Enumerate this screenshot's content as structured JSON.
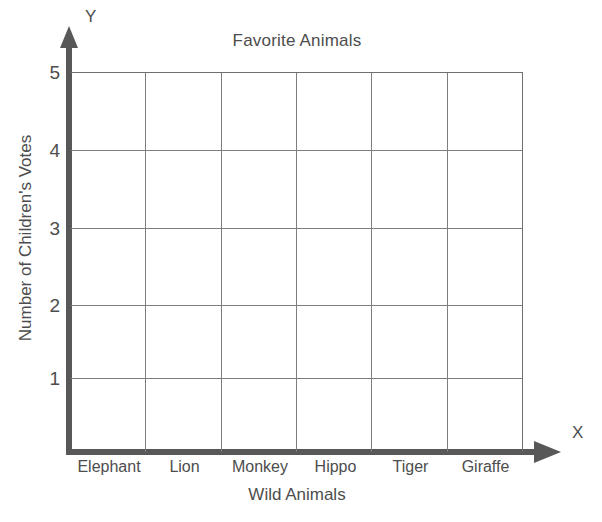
{
  "chart_data": {
    "type": "bar",
    "title": "Favorite Animals",
    "xlabel": "Wild Animals",
    "ylabel": "Number of Children's Votes",
    "categories": [
      "Elephant",
      "Lion",
      "Monkey",
      "Hippo",
      "Tiger",
      "Giraffe"
    ],
    "values": [
      0,
      0,
      0,
      0,
      0,
      0
    ],
    "yticks": [
      "1",
      "2",
      "3",
      "4",
      "5"
    ],
    "ylim": [
      0,
      5
    ],
    "grid": true,
    "legend": "none",
    "note": "Blank grid template — no bars are drawn; every category has no recorded votes.",
    "axis_letters": {
      "x": "X",
      "y": "Y"
    }
  },
  "colors": {
    "axis": "#585858",
    "grid": "#7d7d7d",
    "text": "#4d4d4d",
    "background": "#ffffff"
  }
}
